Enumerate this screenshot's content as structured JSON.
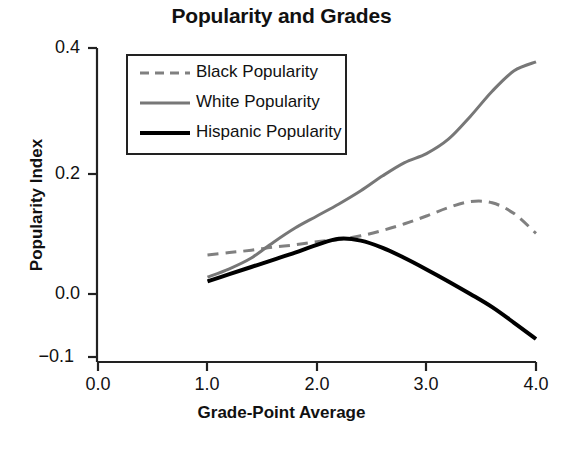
{
  "chart_data": {
    "type": "line",
    "title": "Popularity and Grades",
    "xlabel": "Grade-Point Average",
    "ylabel": "Popularity Index",
    "xlim": [
      0.0,
      4.0
    ],
    "ylim": [
      -0.1,
      0.4
    ],
    "xticks": [
      "0.0",
      "1.0",
      "2.0",
      "3.0",
      "4.0"
    ],
    "xtick_values": [
      0.0,
      1.0,
      2.0,
      3.0,
      4.0
    ],
    "yticks": [
      "0.4",
      "0.2",
      "0.0",
      "−0.1"
    ],
    "ytick_values": [
      0.4,
      0.2,
      0.0,
      -0.1
    ],
    "grid": false,
    "legend_position": "top-left-inside",
    "x": [
      1.0,
      1.2,
      1.4,
      1.6,
      1.8,
      2.0,
      2.2,
      2.4,
      2.6,
      2.8,
      3.0,
      3.2,
      3.4,
      3.6,
      3.8,
      4.0
    ],
    "series": [
      {
        "name": "Black Popularity",
        "label": "Black Popularity",
        "style": "dashed",
        "color": "#808080",
        "width": 3,
        "values": [
          0.065,
          0.069,
          0.073,
          0.078,
          0.082,
          0.087,
          0.091,
          0.097,
          0.106,
          0.117,
          0.13,
          0.144,
          0.154,
          0.152,
          0.134,
          0.101
        ]
      },
      {
        "name": "White Popularity",
        "label": "White Popularity",
        "style": "solid",
        "color": "#777777",
        "width": 3,
        "values": [
          0.028,
          0.042,
          0.06,
          0.086,
          0.11,
          0.13,
          0.15,
          0.172,
          0.197,
          0.219,
          0.234,
          0.258,
          0.296,
          0.338,
          0.372,
          0.387
        ]
      },
      {
        "name": "Hispanic Popularity",
        "label": "Hispanic Popularity",
        "style": "solid",
        "color": "#000000",
        "width": 4,
        "values": [
          0.021,
          0.033,
          0.045,
          0.057,
          0.069,
          0.082,
          0.092,
          0.089,
          0.077,
          0.06,
          0.041,
          0.021,
          0.0,
          -0.022,
          -0.048,
          -0.075
        ]
      }
    ]
  },
  "legend": {
    "items": [
      {
        "label": "Black Popularity"
      },
      {
        "label": "White Popularity"
      },
      {
        "label": "Hispanic Popularity"
      }
    ]
  }
}
